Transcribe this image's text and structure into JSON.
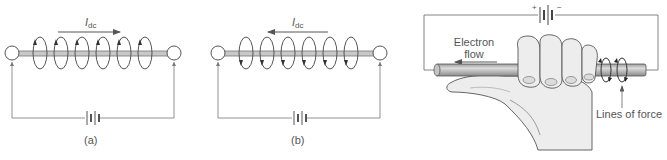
{
  "panels": {
    "a": {
      "caption": "(a)",
      "current_label": "I",
      "current_subscript": "dc",
      "current_direction": "right"
    },
    "b": {
      "caption": "(b)",
      "current_label": "I",
      "current_subscript": "dc",
      "current_direction": "left"
    },
    "c": {
      "battery_plus": "+",
      "battery_minus": "−",
      "electron_flow_line1": "Electron",
      "electron_flow_line2": "flow",
      "lines_of_force": "Lines of force"
    }
  },
  "colors": {
    "line": "#666666",
    "wire_fill": "#b8b8b8",
    "hand_fill": "#ececec",
    "hand_stroke": "#555555"
  }
}
